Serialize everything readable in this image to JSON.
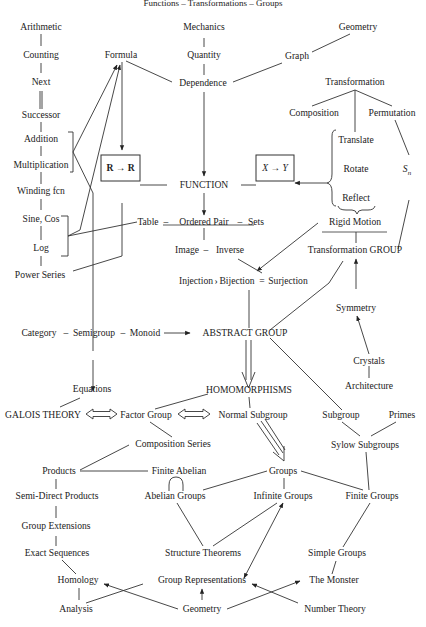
{
  "title": "Functions – Transformations – Groups",
  "nodes": {
    "arithmetic": "Arithmetic",
    "counting": "Counting",
    "next": "Next",
    "successor": "Successor",
    "addition": "Addition",
    "multiplication": "Multiplication",
    "winding_fcn": "Winding fcn",
    "sine_cos": "Sine, Cos",
    "log": "Log",
    "power_series": "Power Series",
    "formula": "Formula",
    "r_to_r": "R → R",
    "mechanics": "Mechanics",
    "quantity": "Quantity",
    "dependence": "Dependence",
    "graph": "Graph",
    "geometry_top": "Geometry",
    "function": "FUNCTION",
    "x_to_y": "X → Y",
    "transformation": "Transformation",
    "composition": "Composition",
    "permutation": "Permutation",
    "translate": "Translate",
    "rotate": "Rotate",
    "reflect": "Reflect",
    "s_n": "S",
    "s_n_sub": "n",
    "rigid_motion": "Rigid Motion",
    "transformation_group": "Transformation GROUP",
    "table": "Table",
    "ordered_pair": "Ordered Pair",
    "sets": "Sets",
    "image": "Image",
    "inverse": "Inverse",
    "injection": "Injection",
    "bijection": "Bijection",
    "surjection": "Surjection",
    "symmetry": "Symmetry",
    "crystals": "Crystals",
    "architecture": "Architecture",
    "category": "Category",
    "semigroup": "Semigroup",
    "monoid": "Monoid",
    "abstract_group": "ABSTRACT GROUP",
    "equations": "Equations",
    "homomorphisms": "HOMOMORPHISMS",
    "galois_theory": "GALOIS THEORY",
    "factor_group": "Factor Group",
    "normal_subgroup": "Normal Subgroup",
    "subgroup": "Subgroup",
    "primes": "Primes",
    "sylow_subgroups": "Sylow Subgroups",
    "composition_series": "Composition Series",
    "products": "Products",
    "finite_abelian": "Finite Abelian",
    "groups": "Groups",
    "abelian_groups": "Abelian Groups",
    "infinite_groups": "Infinite Groups",
    "finite_groups": "Finite Groups",
    "semi_direct_products": "Semi-Direct Products",
    "group_extensions": "Group Extensions",
    "exact_sequences": "Exact Sequences",
    "structure_theorems": "Structure Theorems",
    "simple_groups": "Simple Groups",
    "homology": "Homology",
    "group_representations": "Group Representations",
    "the_monster": "The Monster",
    "analysis": "Analysis",
    "geometry_bottom": "Geometry",
    "number_theory": "Number Theory"
  },
  "separators": {
    "dash": "–",
    "equals": "="
  }
}
